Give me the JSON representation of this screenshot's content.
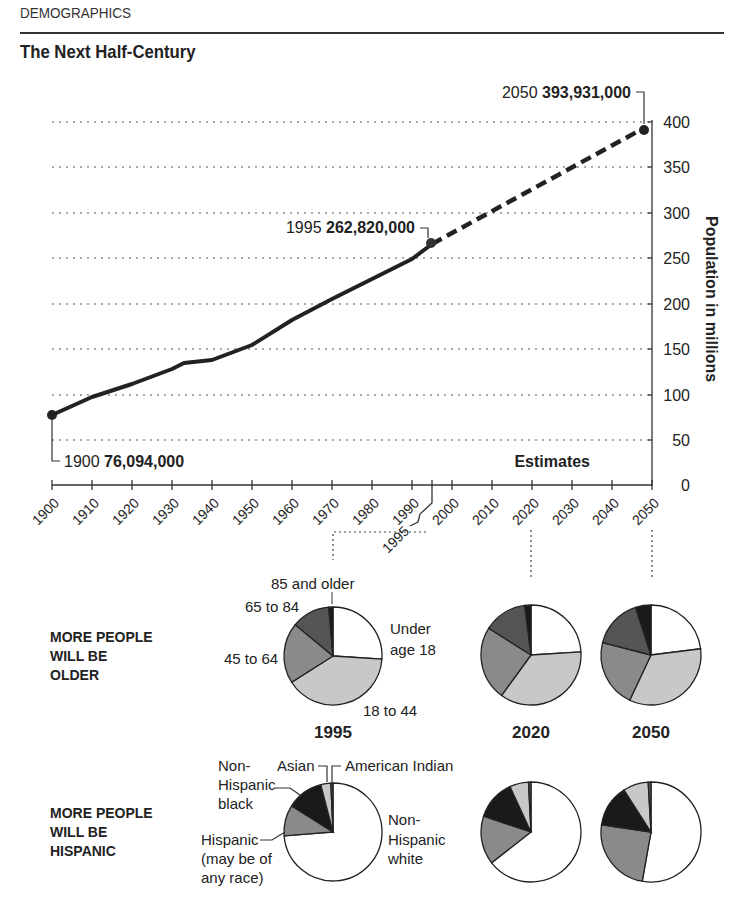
{
  "header": {
    "kicker": "DEMOGRAPHICS",
    "title": "The Next Half-Century"
  },
  "chart_data": [
    {
      "type": "line",
      "title": "The Next Half-Century",
      "ylabel": "Population in millions",
      "xlabel": "",
      "ylim": [
        0,
        400
      ],
      "yticks": [
        0,
        50,
        100,
        150,
        200,
        250,
        300,
        350,
        400
      ],
      "xticks": [
        1900,
        1910,
        1920,
        1930,
        1940,
        1950,
        1960,
        1970,
        1980,
        1990,
        2000,
        2010,
        2020,
        2030,
        2040,
        2050
      ],
      "extra_xtick": 1995,
      "grid": "horizontal dotted",
      "series": [
        {
          "name": "Actual",
          "style": "solid",
          "x": [
            1900,
            1910,
            1920,
            1930,
            1933,
            1940,
            1950,
            1960,
            1970,
            1980,
            1990,
            1995
          ],
          "values": [
            76.1,
            92.4,
            106.5,
            123.2,
            130,
            132.2,
            151.3,
            179.3,
            203.3,
            226.5,
            248.7,
            262.8
          ]
        },
        {
          "name": "Estimates",
          "style": "dashed",
          "x": [
            1995,
            2050
          ],
          "values": [
            262.8,
            393.9
          ]
        }
      ],
      "annotations": [
        {
          "year": "1900",
          "value": "76,094,000"
        },
        {
          "year": "1995",
          "value": "262,820,000"
        },
        {
          "year": "2050",
          "value": "393,931,000"
        },
        {
          "text": "Estimates"
        }
      ]
    },
    {
      "type": "pie",
      "title": "MORE PEOPLE WILL BE OLDER",
      "labels": [
        "Under age 18",
        "18 to 44",
        "45 to 64",
        "65 to 84",
        "85 and older"
      ],
      "years": [
        "1995",
        "2020",
        "2050"
      ],
      "series": [
        {
          "name": "1995",
          "values": [
            26,
            40,
            20,
            12.6,
            1.4
          ]
        },
        {
          "name": "2020",
          "values": [
            24,
            36,
            24,
            14,
            2
          ]
        },
        {
          "name": "2050",
          "values": [
            23,
            34,
            22,
            16,
            5
          ]
        }
      ]
    },
    {
      "type": "pie",
      "title": "MORE PEOPLE WILL BE HISPANIC",
      "labels": [
        "Non-Hispanic white",
        "Hispanic (may be of any race)",
        "Non-Hispanic black",
        "Asian",
        "American Indian"
      ],
      "years": [
        "1995",
        "2020",
        "2050"
      ],
      "series": [
        {
          "name": "1995",
          "values": [
            73.6,
            10.2,
            12.0,
            3.3,
            0.7
          ]
        },
        {
          "name": "2020",
          "values": [
            64.3,
            15.7,
            12.9,
            6.1,
            0.8
          ]
        },
        {
          "name": "2050",
          "values": [
            52.8,
            24.5,
            13.6,
            8.2,
            0.9
          ]
        }
      ]
    }
  ],
  "line_chart": {
    "ylabel": "Population in millions",
    "yticks": [
      "0",
      "50",
      "100",
      "150",
      "200",
      "250",
      "300",
      "350",
      "400"
    ],
    "xticks": [
      "1900",
      "1910",
      "1920",
      "1930",
      "1940",
      "1950",
      "1960",
      "1970",
      "1980",
      "1990",
      "2000",
      "2010",
      "2020",
      "2030",
      "2040",
      "2050"
    ],
    "tick_1995": "1995",
    "estimates_label": "Estimates",
    "ann_1900_year": "1900",
    "ann_1900_value": "76,094,000",
    "ann_1995_year": "1995",
    "ann_1995_value": "262,820,000",
    "ann_2050_year": "2050",
    "ann_2050_value": "393,931,000"
  },
  "age_section": {
    "heading_lines": [
      "MORE PEOPLE",
      "WILL BE",
      "OLDER"
    ],
    "labels": {
      "over85": "85 and older",
      "a65_84": "65 to 84",
      "a45_64": "45 to 64",
      "under18_l1": "Under",
      "under18_l2": "age 18",
      "a18_44": "18 to 44"
    },
    "years": [
      "1995",
      "2020",
      "2050"
    ]
  },
  "race_section": {
    "heading_lines": [
      "MORE PEOPLE",
      "WILL BE",
      "HISPANIC"
    ],
    "labels": {
      "black_l1": "Non-",
      "black_l2": "Hispanic",
      "black_l3": "black",
      "asian": "Asian",
      "amind": "American Indian",
      "hisp_l1": "Hispanic",
      "hisp_l2": "(may be of",
      "hisp_l3": "any race)",
      "white_l1": "Non-",
      "white_l2": "Hispanic",
      "white_l3": "white"
    }
  },
  "colors": {
    "ink": "#222222",
    "white_slice": "#ffffff",
    "light_gray": "#c8c8c8",
    "mid_gray": "#8a8a8a",
    "dark_gray": "#555555",
    "black": "#1a1a1a"
  }
}
